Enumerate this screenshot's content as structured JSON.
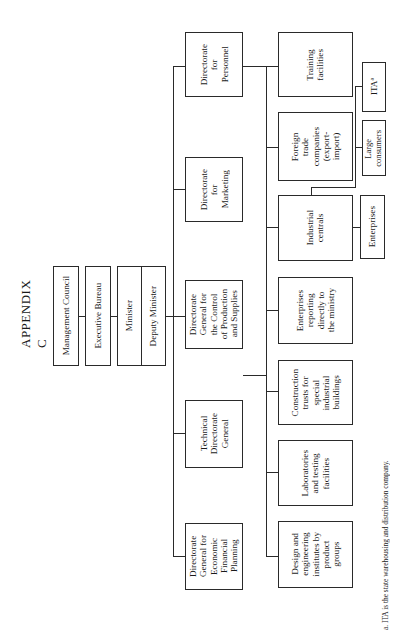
{
  "title": "APPENDIX C",
  "orientation": "rotated 90° counter-clockwise",
  "top": {
    "management_council": "Management Council",
    "executive_bureau": "Executive Bureau",
    "minister": "Minister",
    "deputy_minister": "Deputy Minister"
  },
  "directorates": [
    {
      "id": "economic",
      "label": "Directorate\nGeneral for\nEconomic\nFinancial\nPlanning"
    },
    {
      "id": "technical",
      "label": "Technical\nDirectorate\nGeneral"
    },
    {
      "id": "production",
      "label": "Directorate\nGeneral for\nthe Control\nof Production\nand Supplies"
    },
    {
      "id": "marketing",
      "label": "Directorate\nfor\nMarketing"
    },
    {
      "id": "personnel",
      "label": "Directorate\nfor\nPersonnel"
    }
  ],
  "units": [
    {
      "id": "design",
      "label": "Design and\nengineering\ninstitutes by\nproduct\ngroups"
    },
    {
      "id": "laboratories",
      "label": "Laboratories\nand testing\nfacilities"
    },
    {
      "id": "construction",
      "label": "Construction\ntrusts for\nspecial\nindustrial\nbuildings"
    },
    {
      "id": "enterprises_direct",
      "label": "Enterprises\nreporting\ndirectly to\nthe ministry"
    },
    {
      "id": "industrial_centrals",
      "label": "Industrial\ncentrals"
    },
    {
      "id": "foreign_trade",
      "label": "Foreign\ntrade\ncompanies\n(export-\nimport)"
    },
    {
      "id": "training",
      "label": "Training\nfacilities"
    }
  ],
  "sub_units": [
    {
      "id": "enterprises",
      "label": "Enterprises",
      "parent": "industrial_centrals"
    },
    {
      "id": "large_consumers",
      "label": "Large\nconsumers",
      "parent": "foreign_trade"
    },
    {
      "id": "ita",
      "label": "ITAª",
      "parent": "foreign_trade"
    }
  ],
  "footnote": "a. ITA is the state warehousing and distribution company."
}
